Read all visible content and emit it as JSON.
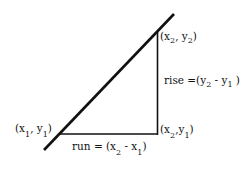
{
  "diagram": {
    "line_color": "#111111",
    "points": {
      "p2": {
        "label_open": "(x",
        "sub_a": "2",
        "mid": ", y",
        "sub_b": "2",
        "label_close": ")"
      },
      "p1": {
        "label_open": "(x",
        "sub_a": "1",
        "mid": ", y",
        "sub_b": "1",
        "label_close": ")"
      },
      "corner": {
        "label_open": "(x",
        "sub_a": "2",
        "mid": ",y",
        "sub_b": "1",
        "label_close": ")"
      }
    },
    "rise": {
      "prefix": "rise =(y",
      "sub_a": "2",
      "mid": " - y",
      "sub_b": "1",
      "suffix": " )"
    },
    "run": {
      "prefix": "run = (x",
      "sub_a": "2",
      "mid": " - x",
      "sub_b": "1",
      "suffix": ")"
    }
  }
}
